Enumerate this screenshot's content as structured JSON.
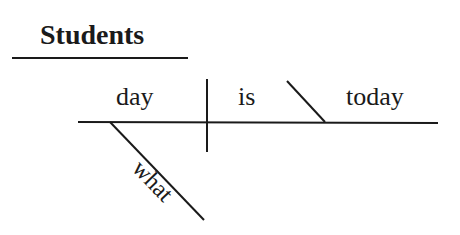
{
  "diagram": {
    "type": "sentence-diagram",
    "title": "Students",
    "words": {
      "subject": "day",
      "verb": "is",
      "complement": "today",
      "modifier": "what"
    }
  }
}
